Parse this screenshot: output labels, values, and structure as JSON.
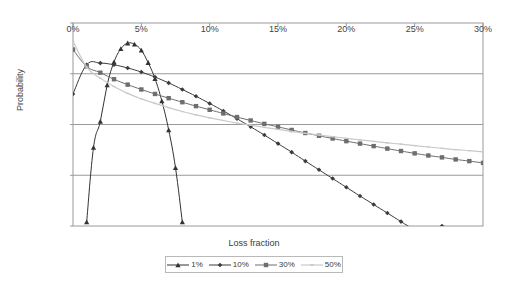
{
  "chart_data": {
    "type": "line",
    "title": "",
    "xlabel": "Loss fraction",
    "ylabel": "Probability",
    "xlim": [
      0,
      30
    ],
    "ylim": [
      0.01,
      100
    ],
    "yscale": "log",
    "xtick_labels": [
      "0%",
      "5%",
      "10%",
      "15%",
      "20%",
      "25%",
      "30%"
    ],
    "xticks": [
      0,
      5,
      10,
      15,
      20,
      25,
      30
    ],
    "ytick_labels": [
      "100.00%",
      "10.00%",
      "1.00%",
      "0.10%",
      "0.01%"
    ],
    "yticks": [
      100,
      10,
      1,
      0.1,
      0.01
    ],
    "xaxis_position": "top",
    "grid": "horizontal",
    "legend_position": "bottom",
    "series": [
      {
        "name": "1%",
        "marker": "triangle",
        "color": "#333333",
        "x": [
          1.0,
          1.5,
          2.0,
          2.5,
          3.0,
          3.5,
          4.0,
          4.5,
          5.0,
          5.5,
          6.0,
          6.5,
          7.0,
          7.5,
          8.0
        ],
        "y": [
          0.012,
          0.35,
          1.15,
          6.0,
          17.0,
          31.0,
          40.0,
          38.0,
          29.0,
          16.5,
          8.0,
          2.9,
          0.78,
          0.14,
          0.012
        ]
      },
      {
        "name": "10%",
        "marker": "diamond",
        "color": "#3c3c3c",
        "x": [
          0,
          1,
          2,
          3,
          4,
          5,
          6,
          7,
          8,
          9,
          10,
          11,
          12,
          13,
          14,
          15,
          16,
          17,
          18,
          19,
          20,
          21,
          22,
          23,
          24,
          25,
          26,
          27
        ],
        "y": [
          4.0,
          15.0,
          16.2,
          15.0,
          13.0,
          10.8,
          8.6,
          6.6,
          4.9,
          3.6,
          2.6,
          1.85,
          1.3,
          0.9,
          0.62,
          0.42,
          0.285,
          0.19,
          0.128,
          0.086,
          0.058,
          0.039,
          0.0265,
          0.018,
          0.0122,
          0.0083,
          0.0056,
          0.01
        ]
      },
      {
        "name": "30%",
        "marker": "square",
        "color": "#6e6e6e",
        "x": [
          0,
          1,
          2,
          3,
          4,
          5,
          6,
          7,
          8,
          9,
          10,
          11,
          12,
          13,
          14,
          15,
          16,
          17,
          18,
          19,
          20,
          21,
          22,
          23,
          24,
          25,
          26,
          27,
          28,
          29,
          30
        ],
        "y": [
          30.0,
          14.0,
          10.5,
          7.8,
          6.1,
          4.9,
          4.0,
          3.3,
          2.75,
          2.3,
          1.95,
          1.65,
          1.4,
          1.2,
          1.03,
          0.9,
          0.78,
          0.68,
          0.6,
          0.53,
          0.47,
          0.42,
          0.375,
          0.335,
          0.3,
          0.27,
          0.245,
          0.225,
          0.205,
          0.19,
          0.175
        ]
      },
      {
        "name": "50%",
        "marker": "small-x",
        "color": "#c9c9c9",
        "x": [
          0,
          1,
          2,
          3,
          4,
          5,
          6,
          7,
          8,
          9,
          10,
          11,
          12,
          13,
          14,
          15,
          16,
          17,
          18,
          19,
          20,
          21,
          22,
          23,
          24,
          25,
          26,
          27,
          28,
          29,
          30
        ],
        "y": [
          44.0,
          13.5,
          8.2,
          5.6,
          4.1,
          3.2,
          2.6,
          2.15,
          1.8,
          1.55,
          1.35,
          1.2,
          1.07,
          0.97,
          0.88,
          0.8,
          0.73,
          0.67,
          0.62,
          0.575,
          0.535,
          0.5,
          0.465,
          0.435,
          0.41,
          0.385,
          0.36,
          0.34,
          0.32,
          0.305,
          0.29
        ]
      }
    ]
  },
  "axes": {
    "y_title": "Probability",
    "x_title": "Loss fraction"
  },
  "legend": {
    "items": [
      {
        "label": "1%"
      },
      {
        "label": "10%"
      },
      {
        "label": "30%"
      },
      {
        "label": "50%"
      }
    ]
  },
  "colors": {
    "axis": "#9a9a9a",
    "grid": "#9a9a9a",
    "text": "#3a3a3a",
    "series_1": "#333333",
    "series_10": "#3c3c3c",
    "series_30": "#6e6e6e",
    "series_50": "#c9c9c9"
  }
}
